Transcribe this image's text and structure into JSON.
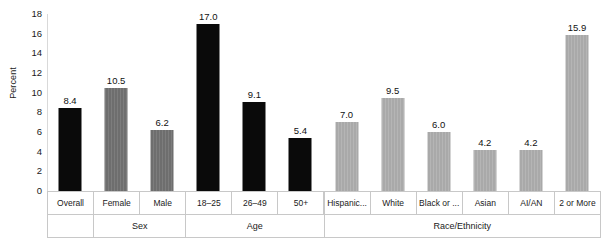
{
  "chart_data": {
    "type": "bar",
    "title": "",
    "xlabel": "",
    "ylabel": "Percent",
    "ylim": [
      0,
      18
    ],
    "ytick_step": 2,
    "yticks": [
      "18",
      "16",
      "14",
      "12",
      "10",
      "8",
      "6",
      "4",
      "2",
      "0"
    ],
    "grid": false,
    "legend": null,
    "categories": [
      "Overall",
      "Female",
      "Male",
      "18–25",
      "26–49",
      "50+",
      "Hispanic...",
      "White",
      "Black or ...",
      "Asian",
      "AI/AN",
      "2 or More"
    ],
    "values": [
      8.4,
      10.5,
      6.2,
      17.0,
      9.1,
      5.4,
      7.0,
      9.5,
      6.0,
      4.2,
      4.2,
      15.9
    ],
    "value_labels": [
      "8.4",
      "10.5",
      "6.2",
      "17.0",
      "9.1",
      "5.4",
      "7.0",
      "9.5",
      "6.0",
      "4.2",
      "4.2",
      "15.9"
    ],
    "bar_styles": [
      "black",
      "mid",
      "mid",
      "black",
      "black",
      "black",
      "light",
      "light",
      "light",
      "light",
      "light",
      "light"
    ],
    "groups": [
      {
        "label": "",
        "span": 1
      },
      {
        "label": "Sex",
        "span": 2
      },
      {
        "label": "Age",
        "span": 3
      },
      {
        "label": "Race/Ethnicity",
        "span": 6
      }
    ],
    "colors": {
      "black": "#0a0a0a",
      "mid": "#6e6e6e",
      "light": "#a9a9a9",
      "axis": "#d9d9d9",
      "table_border": "#c8c8c8",
      "text": "#1a1a1a",
      "background": "#ffffff"
    }
  }
}
